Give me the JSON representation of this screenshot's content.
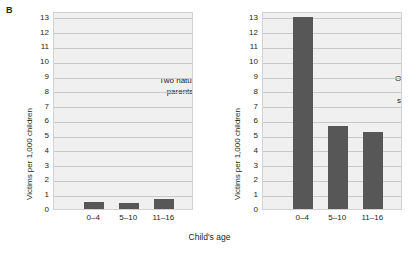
{
  "panel_letter": "B",
  "x_axis_title": "Child's age",
  "chart_data": {
    "type": "bar",
    "title": "B",
    "xlabel": "Child's age",
    "ylabel": "Victims per 1,000 children",
    "ylim": [
      0,
      13.4
    ],
    "yticks": [
      0,
      1,
      2,
      3,
      4,
      5,
      6,
      7,
      8,
      9,
      10,
      11,
      12,
      13
    ],
    "grid": true,
    "legend": "none",
    "categories": [
      "0–4",
      "5–10",
      "11–16"
    ],
    "bar_color": "#575757",
    "plot_background": "#f0f0f0",
    "gridline_color": "#c9c9c9",
    "panels": [
      {
        "id": "two-natural-parents",
        "annotation": "Two natural\nparents",
        "ylabel": "Victims per 1,000 children",
        "categories": [
          "0–4",
          "5–10",
          "11–16"
        ],
        "values": [
          0.5,
          0.4,
          0.7
        ]
      },
      {
        "id": "one-natural-one-stepparent",
        "annotation": "One natural\nand one\nstepparent",
        "ylabel": "Victims per 1,000 children",
        "categories": [
          "0–4",
          "5–10",
          "11–16"
        ],
        "values": [
          13.0,
          5.6,
          5.2
        ]
      }
    ]
  }
}
